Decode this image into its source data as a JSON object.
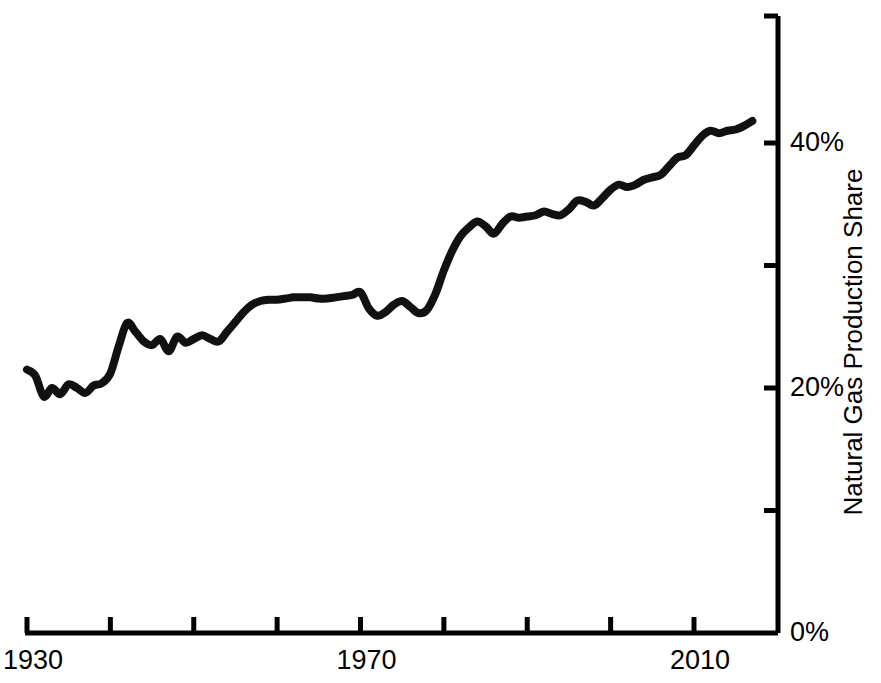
{
  "chart_data": {
    "type": "line",
    "title": "",
    "subtitle": "",
    "xlabel": "",
    "ylabel": "Natural Gas Production Share",
    "xlim": [
      1930,
      2018
    ],
    "ylim": [
      0,
      50
    ],
    "grid": false,
    "legend": null,
    "line_color": "#111111",
    "line_width": 8,
    "axis_color": "#000000",
    "background_color": "#ffffff",
    "x_tick_values": [
      1930,
      1940,
      1950,
      1960,
      1970,
      1980,
      1990,
      2000,
      2010
    ],
    "x_tick_labels": [
      "1930",
      "",
      "",
      "",
      "1970",
      "",
      "",
      "",
      "2010"
    ],
    "y_tick_values": [
      0,
      10,
      20,
      30,
      40
    ],
    "y_tick_labels": [
      "0%",
      "",
      "20%",
      "",
      "40%"
    ],
    "y_unit": "%",
    "series": [
      {
        "name": "Natural Gas Production Share",
        "x": [
          1930,
          1931,
          1932,
          1933,
          1934,
          1935,
          1936,
          1937,
          1938,
          1939,
          1940,
          1941,
          1942,
          1943,
          1944,
          1945,
          1946,
          1947,
          1948,
          1949,
          1950,
          1951,
          1952,
          1953,
          1954,
          1955,
          1956,
          1957,
          1958,
          1959,
          1960,
          1961,
          1962,
          1963,
          1964,
          1965,
          1966,
          1967,
          1968,
          1969,
          1970,
          1971,
          1972,
          1973,
          1974,
          1975,
          1976,
          1977,
          1978,
          1979,
          1980,
          1981,
          1982,
          1983,
          1984,
          1985,
          1986,
          1987,
          1988,
          1989,
          1990,
          1991,
          1992,
          1993,
          1994,
          1995,
          1996,
          1997,
          1998,
          1999,
          2000,
          2001,
          2002,
          2003,
          2004,
          2005,
          2006,
          2007,
          2008,
          2009,
          2010,
          2011,
          2012,
          2013,
          2014,
          2015,
          2016,
          2017
        ],
        "values": [
          21.5,
          21.0,
          19.3,
          20.0,
          19.5,
          20.3,
          20.0,
          19.6,
          20.2,
          20.4,
          21.2,
          23.4,
          25.3,
          24.6,
          23.8,
          23.5,
          24.0,
          23.0,
          24.2,
          23.7,
          24.0,
          24.3,
          24.0,
          23.8,
          24.6,
          25.4,
          26.2,
          26.8,
          27.1,
          27.2,
          27.2,
          27.3,
          27.4,
          27.4,
          27.4,
          27.3,
          27.3,
          27.4,
          27.5,
          27.6,
          27.8,
          26.5,
          25.9,
          26.2,
          26.8,
          27.1,
          26.6,
          26.1,
          26.4,
          27.7,
          29.6,
          31.2,
          32.4,
          33.1,
          33.6,
          33.2,
          32.6,
          33.4,
          34.0,
          33.9,
          34.0,
          34.1,
          34.4,
          34.2,
          34.1,
          34.6,
          35.3,
          35.2,
          34.9,
          35.5,
          36.2,
          36.6,
          36.4,
          36.6,
          37.0,
          37.2,
          37.4,
          38.1,
          38.8,
          39.0,
          39.8,
          40.6,
          41.0,
          40.8,
          41.0,
          41.1,
          41.4,
          41.8
        ]
      }
    ]
  },
  "axis": {
    "y_title": "Natural Gas Production Share",
    "x_labels": [
      {
        "text": "1930",
        "value": 1930
      },
      {
        "text": "1970",
        "value": 1970
      },
      {
        "text": "2010",
        "value": 2010
      }
    ],
    "y_labels": [
      {
        "text": "0%",
        "value": 0
      },
      {
        "text": "20%",
        "value": 20
      },
      {
        "text": "40%",
        "value": 40
      }
    ]
  }
}
